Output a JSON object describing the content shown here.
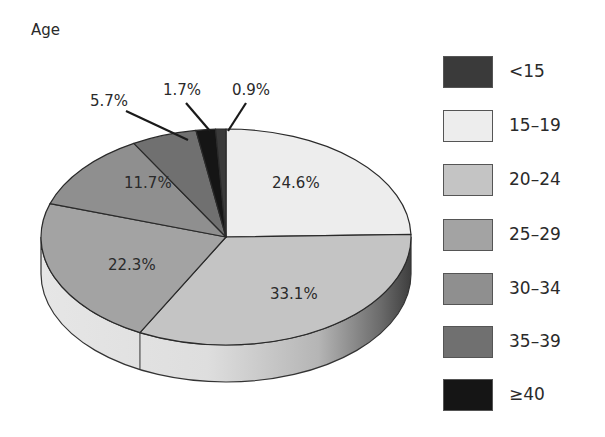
{
  "chart_data": {
    "type": "pie",
    "title": "Age",
    "style": "3d-elliptical",
    "categories": [
      "<15",
      "15–19",
      "20–24",
      "25–29",
      "30–34",
      "35–39",
      "≥40"
    ],
    "values": [
      0.9,
      24.6,
      33.1,
      22.3,
      11.7,
      5.7,
      1.7
    ],
    "value_labels": [
      "0.9%",
      "24.6%",
      "33.1%",
      "22.3%",
      "11.7%",
      "5.7%",
      "1.7%"
    ],
    "unit": "%",
    "draw_order_clockwise_from_top": [
      "15–19",
      "20–24",
      "25–29",
      "30–34",
      "35–39",
      "≥40",
      "<15"
    ],
    "legend_position": "right",
    "colors": {
      "<15": "#3a3a3a",
      "15–19": "#ededed",
      "20–24": "#c4c4c4",
      "25–29": "#a3a3a3",
      "30–34": "#8f8f8f",
      "35–39": "#707070",
      "≥40": "#151515"
    }
  },
  "title": "Age",
  "legend": [
    {
      "label": "<15",
      "color": "#3a3a3a"
    },
    {
      "label": "15–19",
      "color": "#ededed"
    },
    {
      "label": "20–24",
      "color": "#c4c4c4"
    },
    {
      "label": "25–29",
      "color": "#a3a3a3"
    },
    {
      "label": "30–34",
      "color": "#8f8f8f"
    },
    {
      "label": "35–39",
      "color": "#707070"
    },
    {
      "label": "≥40",
      "color": "#151515"
    }
  ],
  "labels": {
    "l15_19": "24.6%",
    "l20_24": "33.1%",
    "l25_29": "22.3%",
    "l30_34": "11.7%",
    "l35_39": "5.7%",
    "l40": "1.7%",
    "lunder15": "0.9%"
  }
}
